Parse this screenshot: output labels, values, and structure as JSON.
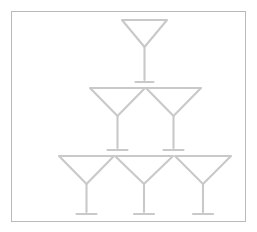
{
  "image": {
    "title": "Pyramid of cocktail glasses",
    "description": "Line drawing of a champagne/martini glass tower arranged as a pyramid inside a thin rectangular border",
    "background_color": "#ffffff",
    "line_color": "#c9c9c9",
    "border_color": "#b9b9b9",
    "width": 257,
    "height": 232
  },
  "frame": {
    "name": "picture-border",
    "x": 11,
    "y": 11,
    "width": 235,
    "height": 211,
    "stroke": "#b9b9b9",
    "stroke_width": 1
  },
  "chart_data": {
    "type": "diagram",
    "rows": 3,
    "glass_counts": [
      1,
      2,
      3
    ],
    "total_glasses": 6,
    "shape": "triangular-pyramid"
  },
  "glasses": [
    {
      "id": "glass-top-1",
      "row": 1,
      "position": 1,
      "label": "Top glass",
      "rim_left_x": 122,
      "rim_right_x": 167,
      "rim_y": 20,
      "bowl_bottom_y": 47,
      "stem_x": 144.5,
      "foot_y": 82,
      "foot_half_width": 9
    },
    {
      "id": "glass-middle-1",
      "row": 2,
      "position": 1,
      "label": "Middle left glass",
      "rim_left_x": 90,
      "rim_right_x": 145,
      "rim_y": 88,
      "bowl_bottom_y": 116,
      "stem_x": 117.5,
      "foot_y": 150,
      "foot_half_width": 10
    },
    {
      "id": "glass-middle-2",
      "row": 2,
      "position": 2,
      "label": "Middle right glass",
      "rim_left_x": 146,
      "rim_right_x": 201,
      "rim_y": 88,
      "bowl_bottom_y": 116,
      "stem_x": 173.5,
      "foot_y": 150,
      "foot_half_width": 10
    },
    {
      "id": "glass-bottom-1",
      "row": 3,
      "position": 1,
      "label": "Bottom left glass",
      "rim_left_x": 59,
      "rim_right_x": 114,
      "rim_y": 156,
      "bowl_bottom_y": 184,
      "stem_x": 86.5,
      "foot_y": 214,
      "foot_half_width": 10
    },
    {
      "id": "glass-bottom-2",
      "row": 3,
      "position": 2,
      "label": "Bottom middle glass",
      "rim_left_x": 115,
      "rim_right_x": 173,
      "rim_y": 156,
      "bowl_bottom_y": 184,
      "stem_x": 144,
      "foot_y": 214,
      "foot_half_width": 10
    },
    {
      "id": "glass-bottom-3",
      "row": 3,
      "position": 3,
      "label": "Bottom right glass",
      "rim_left_x": 175,
      "rim_right_x": 231,
      "rim_y": 156,
      "bowl_bottom_y": 184,
      "stem_x": 203,
      "foot_y": 214,
      "foot_half_width": 10
    }
  ]
}
